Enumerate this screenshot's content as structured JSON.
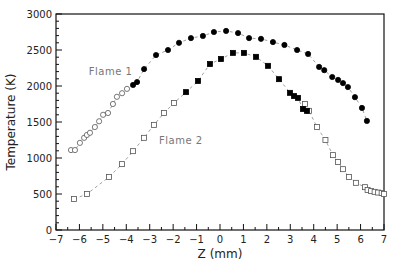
{
  "chart_data": {
    "type": "scatter",
    "title": "",
    "xlabel": "Z  (mm)",
    "ylabel": "Temperature  (K)",
    "xlim": [
      -7,
      7
    ],
    "ylim": [
      0,
      3000
    ],
    "xticks": [
      -7,
      -6,
      -5,
      -4,
      -3,
      -2,
      -1,
      0,
      1,
      2,
      3,
      4,
      5,
      6,
      7
    ],
    "yticks": [
      0,
      500,
      1000,
      1500,
      2000,
      2500,
      3000
    ],
    "grid": false,
    "legend": "inline labels",
    "annotations": [
      {
        "text": "Flame 1",
        "x": -5.6,
        "y": 2150
      },
      {
        "text": "Flame 2",
        "x": -2.6,
        "y": 1200
      }
    ],
    "series": [
      {
        "name": "Flame 1",
        "marker": "circle",
        "line": "dashed",
        "open_points": [
          [
            -6.36,
            1110
          ],
          [
            -6.19,
            1110
          ],
          [
            -5.98,
            1210
          ],
          [
            -5.8,
            1280
          ],
          [
            -5.68,
            1320
          ],
          [
            -5.55,
            1350
          ],
          [
            -5.34,
            1430
          ],
          [
            -5.16,
            1510
          ],
          [
            -4.99,
            1600
          ],
          [
            -4.78,
            1625
          ],
          [
            -4.57,
            1750
          ],
          [
            -4.4,
            1850
          ],
          [
            -4.18,
            1900
          ],
          [
            -3.97,
            1960
          ]
        ],
        "filled_points": [
          [
            -3.71,
            2015
          ],
          [
            -3.54,
            2055
          ],
          [
            -3.24,
            2235
          ],
          [
            -2.73,
            2430
          ],
          [
            -2.22,
            2500
          ],
          [
            -1.75,
            2600
          ],
          [
            -1.24,
            2665
          ],
          [
            -0.73,
            2695
          ],
          [
            -0.26,
            2750
          ],
          [
            0.26,
            2765
          ],
          [
            0.77,
            2735
          ],
          [
            1.24,
            2665
          ],
          [
            1.75,
            2655
          ],
          [
            2.26,
            2610
          ],
          [
            2.75,
            2570
          ],
          [
            3.29,
            2500
          ],
          [
            3.76,
            2445
          ],
          [
            4.23,
            2265
          ],
          [
            4.45,
            2220
          ],
          [
            4.79,
            2125
          ],
          [
            5.04,
            2085
          ],
          [
            5.25,
            2040
          ],
          [
            5.46,
            1985
          ],
          [
            5.76,
            1845
          ],
          [
            6.06,
            1695
          ],
          [
            6.27,
            1515
          ]
        ]
      },
      {
        "name": "Flame 2",
        "marker": "square",
        "line": "dashed",
        "open_points": [
          [
            -6.23,
            430
          ],
          [
            -5.68,
            500
          ],
          [
            -4.74,
            735
          ],
          [
            -4.18,
            915
          ],
          [
            -3.71,
            1095
          ],
          [
            -3.24,
            1280
          ],
          [
            -2.82,
            1460
          ],
          [
            -2.39,
            1625
          ],
          [
            -1.96,
            1765
          ],
          [
            3.63,
            1750
          ],
          [
            3.8,
            1655
          ],
          [
            4.14,
            1430
          ],
          [
            4.5,
            1250
          ],
          [
            4.82,
            1040
          ],
          [
            5.04,
            945
          ],
          [
            5.25,
            845
          ],
          [
            5.51,
            735
          ],
          [
            5.8,
            655
          ],
          [
            6.19,
            595
          ],
          [
            6.3,
            555
          ],
          [
            6.45,
            540
          ],
          [
            6.6,
            530
          ],
          [
            6.75,
            520
          ],
          [
            6.9,
            515
          ],
          [
            7.0,
            500
          ]
        ],
        "filled_points": [
          [
            -1.45,
            1915
          ],
          [
            -0.94,
            2070
          ],
          [
            -0.43,
            2305
          ],
          [
            0.04,
            2375
          ],
          [
            0.55,
            2460
          ],
          [
            1.02,
            2460
          ],
          [
            1.54,
            2405
          ],
          [
            2.05,
            2280
          ],
          [
            2.52,
            2095
          ],
          [
            2.99,
            1905
          ],
          [
            3.16,
            1860
          ],
          [
            3.33,
            1835
          ],
          [
            3.54,
            1680
          ],
          [
            3.71,
            1655
          ]
        ]
      }
    ]
  },
  "labels": {
    "flame1": "Flame 1",
    "flame2": "Flame 2",
    "xlabel": "Z  (mm)",
    "ylabel": "Temperature  (K)"
  }
}
